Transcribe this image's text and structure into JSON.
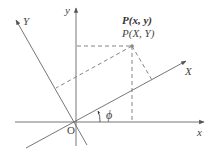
{
  "diagram": {
    "labels": {
      "y_axis": "y",
      "x_axis": "x",
      "Y_axis": "Y",
      "X_axis": "X",
      "origin": "O",
      "angle": "ϕ",
      "point_xy": "P(x, y)",
      "point_XY": "P(X, Y)"
    },
    "colors": {
      "line": "#666666",
      "dashed": "#777777",
      "point": "#888888",
      "text": "#444444"
    }
  }
}
